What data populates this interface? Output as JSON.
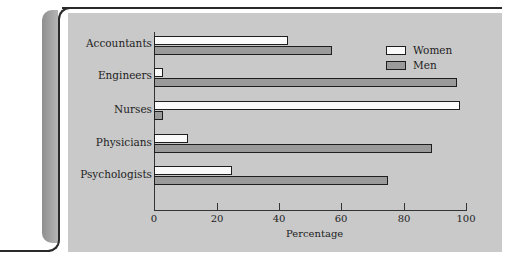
{
  "chart_data": {
    "type": "bar",
    "orientation": "horizontal",
    "title": "",
    "xlabel": "Percentage",
    "ylabel": "",
    "xlim": [
      0,
      100
    ],
    "x_ticks": [
      0,
      20,
      40,
      60,
      80,
      100
    ],
    "grid": false,
    "legend_position": "upper right",
    "categories": [
      "Accountants",
      "Engineers",
      "Nurses",
      "Physicians",
      "Psychologists"
    ],
    "series": [
      {
        "name": "Women",
        "color": "#fafafa",
        "values": [
          43,
          3,
          98,
          11,
          25
        ]
      },
      {
        "name": "Men",
        "color": "#9a9a9a",
        "values": [
          57,
          97,
          3,
          89,
          75
        ]
      }
    ]
  },
  "labels": {
    "categories": [
      "Accountants",
      "Engineers",
      "Nurses",
      "Physicians",
      "Psychologists"
    ],
    "ticks": [
      "0",
      "20",
      "40",
      "60",
      "80",
      "100"
    ],
    "xlabel": "Percentage",
    "legend": [
      "Women",
      "Men"
    ]
  }
}
